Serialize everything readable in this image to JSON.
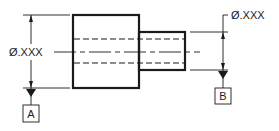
{
  "diagram": {
    "left_dimension": {
      "label": "Ø.XXX",
      "datum": "A"
    },
    "right_dimension": {
      "label": "Ø.XXX",
      "datum": "B"
    },
    "colors": {
      "line": "#1a1a1a",
      "background": "#ffffff"
    }
  }
}
